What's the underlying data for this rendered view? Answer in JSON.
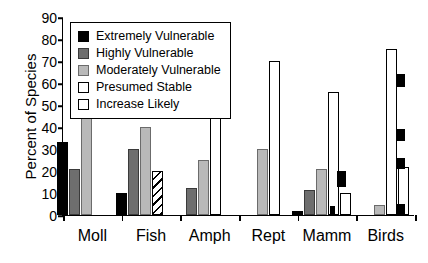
{
  "chart_data": {
    "type": "bar",
    "title": "",
    "xlabel": "",
    "ylabel": "Percent of Species",
    "ylim": [
      0,
      90
    ],
    "yticks": [
      0,
      10,
      20,
      30,
      40,
      50,
      60,
      70,
      80,
      90
    ],
    "grid": false,
    "legend_position": "top-left",
    "categories": [
      "Moll",
      "Fish",
      "Amph",
      "Rept",
      "Mamm",
      "Birds"
    ],
    "series": [
      {
        "name": "Extremely Vulnerable",
        "values": [
          33,
          10,
          0,
          0,
          2,
          0
        ]
      },
      {
        "name": "Highly Vulnerable",
        "values": [
          21,
          30,
          12.5,
          0,
          11.5,
          0
        ]
      },
      {
        "name": "Moderately Vulnerable",
        "values": [
          46,
          40,
          25,
          30,
          21,
          4.5
        ]
      },
      {
        "name": "Presumed Stable",
        "values": [
          0,
          20,
          62,
          70,
          56,
          75.5
        ]
      },
      {
        "name": "Increase Likely",
        "values": [
          0,
          0,
          0,
          0,
          10,
          22
        ]
      }
    ],
    "series_colors": [
      "#000000",
      "#6e6e6e",
      "#b9b9b9",
      "#ffffff",
      "#ffffff"
    ],
    "hatched_bars": [
      "Fish:Presumed Stable"
    ]
  },
  "legend": {
    "items": [
      {
        "label": "Extremely Vulnerable",
        "swatch": "sw-extreme"
      },
      {
        "label": "Highly Vulnerable",
        "swatch": "sw-high"
      },
      {
        "label": "Moderately Vulnerable",
        "swatch": "sw-moderate"
      },
      {
        "label": "Presumed Stable",
        "swatch": "sw-stable"
      },
      {
        "label": "Increase Likely",
        "swatch": "sw-increase"
      }
    ]
  }
}
